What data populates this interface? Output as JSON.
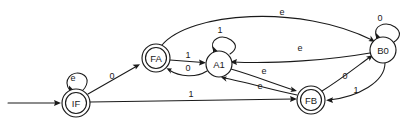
{
  "diagram": {
    "type": "finite-state-machine",
    "title": "",
    "background_color": "#ffffff",
    "stroke_color": "#1a1a1a",
    "width": 411,
    "height": 130,
    "states": [
      {
        "id": "IF",
        "label": "IF",
        "cx": 76,
        "cy": 103,
        "r": 14,
        "accepting": true,
        "initial": true
      },
      {
        "id": "FA",
        "label": "FA",
        "cx": 156,
        "cy": 58,
        "r": 14,
        "accepting": true,
        "initial": false
      },
      {
        "id": "A1",
        "label": "A1",
        "cx": 219,
        "cy": 64,
        "r": 13,
        "accepting": false,
        "initial": false
      },
      {
        "id": "FB",
        "label": "FB",
        "cx": 311,
        "cy": 100,
        "r": 14,
        "accepting": true,
        "initial": false
      },
      {
        "id": "B0",
        "label": "B0",
        "cx": 383,
        "cy": 50,
        "r": 13,
        "accepting": false,
        "initial": false
      }
    ],
    "transitions": [
      {
        "from": "IF",
        "to": "IF",
        "label": "e",
        "kind": "self-loop",
        "label_x": 73,
        "label_y": 78
      },
      {
        "from": "IF",
        "to": "FA",
        "label": "0",
        "kind": "straight",
        "label_x": 112,
        "label_y": 76
      },
      {
        "from": "IF",
        "to": "FB",
        "label": "1",
        "kind": "straight",
        "label_x": 191,
        "label_y": 94
      },
      {
        "from": "FA",
        "to": "A1",
        "label": "1",
        "kind": "straight",
        "label_x": 188,
        "label_y": 55
      },
      {
        "from": "A1",
        "to": "FA",
        "label": "0",
        "kind": "curve",
        "label_x": 188,
        "label_y": 68
      },
      {
        "from": "FA",
        "to": "B0",
        "label": "e",
        "kind": "long-arc",
        "label_x": 282,
        "label_y": 12
      },
      {
        "from": "A1",
        "to": "A1",
        "label": "1",
        "kind": "self-loop",
        "label_x": 220,
        "label_y": 30
      },
      {
        "from": "A1",
        "to": "FB",
        "label": "e",
        "kind": "curve",
        "label_x": 264,
        "label_y": 71
      },
      {
        "from": "FB",
        "to": "A1",
        "label": "e",
        "kind": "curve",
        "label_x": 260,
        "label_y": 86
      },
      {
        "from": "B0",
        "to": "A1",
        "label": "e",
        "kind": "long-arc",
        "label_x": 300,
        "label_y": 48
      },
      {
        "from": "B0",
        "to": "B0",
        "label": "0",
        "kind": "self-loop",
        "label_x": 380,
        "label_y": 18
      },
      {
        "from": "FB",
        "to": "B0",
        "label": "0",
        "kind": "curve",
        "label_x": 345,
        "label_y": 76
      },
      {
        "from": "B0",
        "to": "FB",
        "label": "1",
        "kind": "curve",
        "label_x": 356,
        "label_y": 90
      }
    ],
    "start_arrow": {
      "x1": 8,
      "y1": 103,
      "x2": 60,
      "y2": 103
    }
  }
}
